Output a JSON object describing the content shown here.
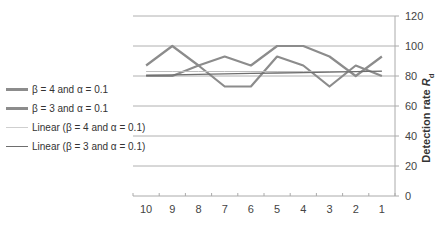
{
  "chart_data": {
    "type": "line",
    "title": "",
    "xlabel": "",
    "ylabel": "Detection rate R_d",
    "ylabel_main": "Detection rate ",
    "ylabel_sym": "R",
    "ylabel_sub": "d",
    "categories": [
      "10",
      "9",
      "8",
      "7",
      "6",
      "5",
      "4",
      "3",
      "2",
      "1"
    ],
    "ylim": [
      0,
      120
    ],
    "yticks": [
      0,
      20,
      40,
      60,
      80,
      100,
      120
    ],
    "grid": true,
    "legend_position": "left",
    "series": [
      {
        "name": "β = 4 and α = 0.1",
        "style": "thick",
        "color": "#8c8c8c",
        "values": [
          87,
          100,
          87,
          73,
          73,
          93,
          87,
          73,
          87,
          80
        ]
      },
      {
        "name": "β = 3 and α = 0.1",
        "style": "thick",
        "color": "#8c8c8c",
        "values": [
          80,
          80,
          87,
          93,
          87,
          100,
          100,
          93,
          80,
          93
        ]
      },
      {
        "name": "Linear (β = 4 and α = 0.1)",
        "style": "thin-light",
        "color": "#bdbdbd",
        "values": [
          83,
          83,
          83,
          83,
          83,
          83,
          83,
          83,
          83,
          83
        ]
      },
      {
        "name": "Linear (β = 3 and α = 0.1)",
        "style": "thin-dark",
        "color": "#6e6e6e",
        "values": [
          80.5,
          80.8,
          81.1,
          81.4,
          81.7,
          82.0,
          82.3,
          82.6,
          82.9,
          83.2
        ]
      }
    ]
  },
  "legend": [
    {
      "label": "β = 4 and α = 0.1"
    },
    {
      "label": "β = 3 and α = 0.1"
    },
    {
      "label": "Linear (β = 4 and α = 0.1)"
    },
    {
      "label": "Linear (β = 3 and α = 0.1)"
    }
  ]
}
